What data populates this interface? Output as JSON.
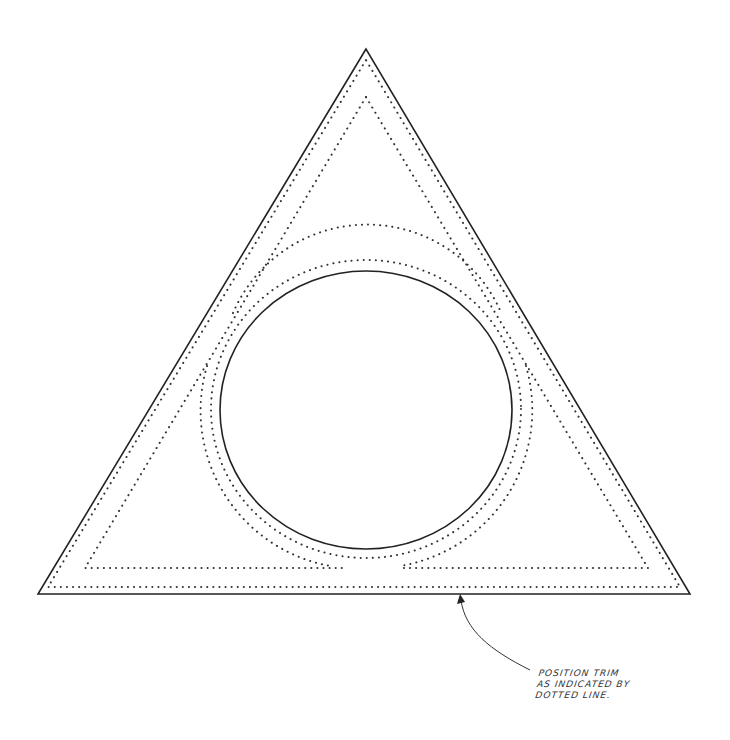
{
  "figure": {
    "type": "pattern-template",
    "colors": {
      "background": "#ffffff",
      "solid_line": "#222222",
      "dotted_line": "#333333",
      "text": "#333333"
    },
    "annotation": {
      "lines": [
        "POSITION TRIM",
        "AS INDICATED BY",
        "DOTTED LINE."
      ]
    }
  }
}
